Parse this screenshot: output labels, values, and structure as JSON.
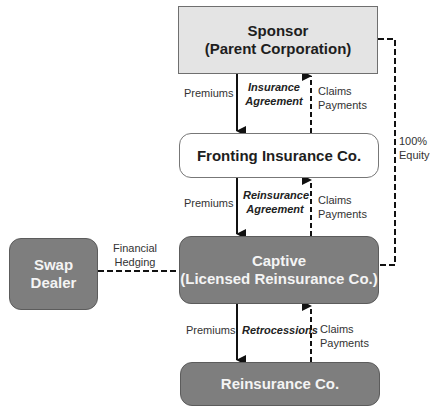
{
  "nodes": {
    "sponsor": {
      "line1": "Sponsor",
      "line2": "(Parent Corporation)"
    },
    "fronting": {
      "line1": "Fronting Insurance Co."
    },
    "captive": {
      "line1": "Captive",
      "line2": "(Licensed Reinsurance Co.)"
    },
    "reinsurance": {
      "line1": "Reinsurance Co."
    },
    "swap_dealer": {
      "line1": "Swap",
      "line2": "Dealer"
    }
  },
  "edges": {
    "sponsor_fronting": {
      "down": "Premiums",
      "agreement_1": "Insurance",
      "agreement_2": "Agreement",
      "up_1": "Claims",
      "up_2": "Payments"
    },
    "fronting_captive": {
      "down": "Premiums",
      "agreement_1": "Reinsurance",
      "agreement_2": "Agreement",
      "up_1": "Claims",
      "up_2": "Payments"
    },
    "captive_reinsurance": {
      "down": "Premiums",
      "agreement_1": "Retrocessions",
      "up_1": "Claims",
      "up_2": "Payments"
    },
    "swap_captive": {
      "line1": "Financial",
      "line2": "Hedging"
    },
    "sponsor_captive": {
      "line1": "100%",
      "line2": "Equity"
    }
  },
  "colors": {
    "sponsor_fill": "#e4e4e4",
    "dark_fill": "#7e7e7e",
    "fronting_fill": "#ffffff"
  }
}
